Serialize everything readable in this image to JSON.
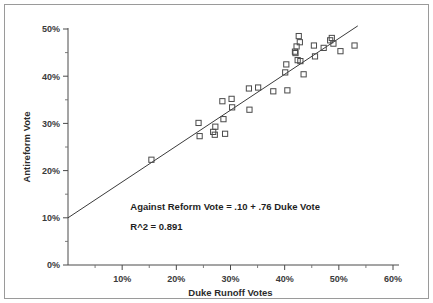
{
  "chart_data": {
    "type": "scatter",
    "title": "",
    "xlabel": "Duke Runoff Votes",
    "ylabel": "Antireform Vote",
    "xlim": [
      0,
      60
    ],
    "ylim": [
      0,
      50
    ],
    "grid": false,
    "legend": "none",
    "x_ticks": [
      "10%",
      "20%",
      "30%",
      "40%",
      "50%",
      "60%"
    ],
    "x_tick_values": [
      10,
      20,
      30,
      40,
      50,
      60
    ],
    "y_ticks": [
      "0%",
      "10%",
      "20%",
      "30%",
      "40%",
      "50%"
    ],
    "y_tick_values": [
      0,
      10,
      20,
      30,
      40,
      50
    ],
    "x_minor_step": 5,
    "y_minor_step": 5,
    "marker_style": "open-square",
    "marker_color": "#4a4a4a",
    "line_color": "#3a3a3a",
    "annotations": [
      {
        "text": "Against Reform Vote = .10 + .76 Duke Vote",
        "x": 11.5,
        "y": 11.6
      },
      {
        "text": "R^2 = 0.891",
        "x": 11.5,
        "y": 7.4
      }
    ],
    "regression": {
      "intercept": 10.0,
      "slope": 0.76,
      "r_squared": 0.891,
      "x_start": 0.0,
      "x_end": 53.5
    },
    "points": [
      {
        "x": 15.4,
        "y": 22.3
      },
      {
        "x": 24.1,
        "y": 30.1
      },
      {
        "x": 24.3,
        "y": 27.3
      },
      {
        "x": 26.8,
        "y": 28.2
      },
      {
        "x": 27.2,
        "y": 29.3
      },
      {
        "x": 27.1,
        "y": 27.6
      },
      {
        "x": 28.5,
        "y": 34.7
      },
      {
        "x": 28.7,
        "y": 30.9
      },
      {
        "x": 29.0,
        "y": 27.8
      },
      {
        "x": 30.2,
        "y": 35.2
      },
      {
        "x": 30.3,
        "y": 33.4
      },
      {
        "x": 33.4,
        "y": 37.4
      },
      {
        "x": 33.5,
        "y": 32.9
      },
      {
        "x": 35.1,
        "y": 37.6
      },
      {
        "x": 37.9,
        "y": 36.8
      },
      {
        "x": 40.1,
        "y": 40.8
      },
      {
        "x": 40.3,
        "y": 42.5
      },
      {
        "x": 40.5,
        "y": 37.0
      },
      {
        "x": 41.9,
        "y": 45.2
      },
      {
        "x": 42.0,
        "y": 44.9
      },
      {
        "x": 42.2,
        "y": 46.3
      },
      {
        "x": 42.4,
        "y": 43.4
      },
      {
        "x": 42.6,
        "y": 48.5
      },
      {
        "x": 42.8,
        "y": 47.2
      },
      {
        "x": 42.9,
        "y": 43.2
      },
      {
        "x": 43.5,
        "y": 40.4
      },
      {
        "x": 45.4,
        "y": 46.5
      },
      {
        "x": 45.6,
        "y": 44.2
      },
      {
        "x": 47.2,
        "y": 46.0
      },
      {
        "x": 48.4,
        "y": 47.6
      },
      {
        "x": 48.7,
        "y": 48.1
      },
      {
        "x": 49.0,
        "y": 46.9
      },
      {
        "x": 50.3,
        "y": 45.3
      },
      {
        "x": 52.9,
        "y": 46.5
      }
    ]
  }
}
